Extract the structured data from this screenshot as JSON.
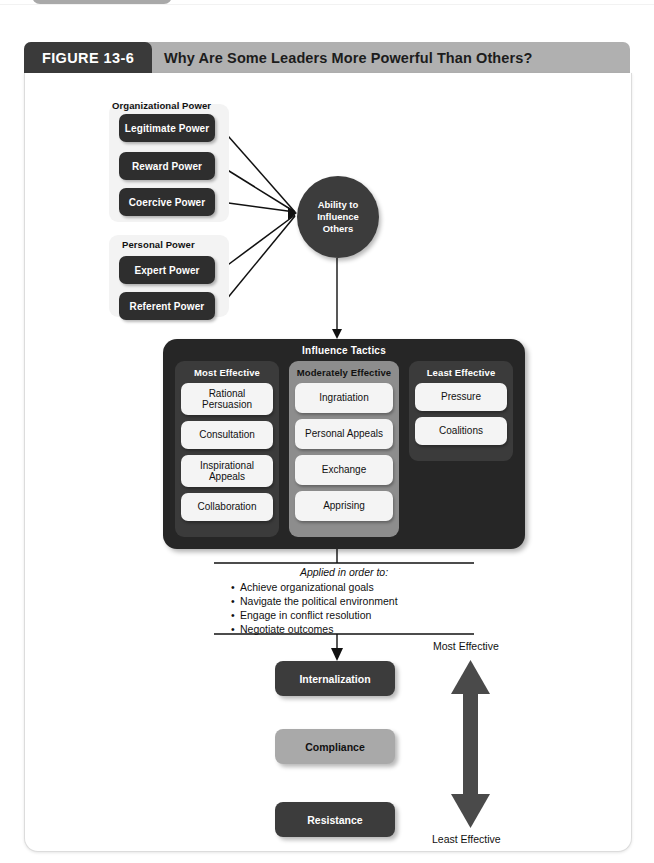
{
  "figure": {
    "tab_label": "FIGURE 13-6",
    "title": "Why Are Some Leaders More Powerful Than Others?"
  },
  "power": {
    "organizational": {
      "label": "Organizational Power",
      "items": [
        "Legitimate Power",
        "Reward Power",
        "Coercive Power"
      ]
    },
    "personal": {
      "label": "Personal Power",
      "items": [
        "Expert Power",
        "Referent Power"
      ]
    }
  },
  "hub": {
    "label": "Ability to\nInfluence\nOthers",
    "line1": "Ability to",
    "line2": "Influence",
    "line3": "Others"
  },
  "tactics": {
    "title": "Influence Tactics",
    "columns": [
      {
        "heading": "Most Effective",
        "items": [
          "Rational\nPersuasion",
          "Consultation",
          "Inspirational\nAppeals",
          "Collaboration"
        ]
      },
      {
        "heading": "Moderately Effective",
        "items": [
          "Ingratiation",
          "Personal Appeals",
          "Exchange",
          "Apprising"
        ]
      },
      {
        "heading": "Least Effective",
        "items": [
          "Pressure",
          "Coalitions"
        ]
      }
    ]
  },
  "applied": {
    "heading": "Applied in order to:",
    "bullets": [
      "Achieve organizational goals",
      "Navigate the political environment",
      "Engage in conflict resolution",
      "Negotiate outcomes"
    ]
  },
  "outcomes": [
    {
      "label": "Internalization",
      "style": "dark"
    },
    {
      "label": "Compliance",
      "style": "mid"
    },
    {
      "label": "Resistance",
      "style": "dark"
    }
  ],
  "effectiveness_scale": {
    "top_label": "Most Effective",
    "bottom_label": "Least Effective"
  },
  "colors": {
    "dark_box": "#2e2e2e",
    "panel": "#262626",
    "panel_column": "#3b3b3b",
    "panel_column_light": "#8d8d8d",
    "light_box": "#f4f4f4",
    "mid_box": "#a9a9a9",
    "header_banner": "#b0b0b0",
    "header_tab": "#3a3a3a",
    "group_bg": "#f3f3f3"
  }
}
